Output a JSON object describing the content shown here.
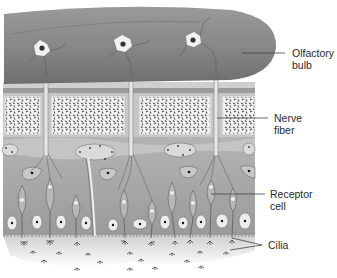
{
  "diagram": {
    "colors": {
      "bulb": "#8a8a8a",
      "bulb_highlight": "#a5a5a5",
      "bone_plate": "#b0b0b0",
      "bone_block": "#f2f2f2",
      "tissue": "#a8a8a8",
      "epithelium": "#9c9c9c",
      "mucus": "#e6e6e6",
      "cell_body": "#d8d8d8"
    },
    "labels": [
      {
        "id": "olfactory-bulb",
        "lines": [
          "Olfactory",
          "bulb"
        ]
      },
      {
        "id": "nerve-fiber",
        "lines": [
          "Nerve",
          "fiber"
        ]
      },
      {
        "id": "receptor-cell",
        "lines": [
          "Receptor",
          "cell"
        ]
      },
      {
        "id": "cilia",
        "lines": [
          "Cilia"
        ]
      }
    ]
  }
}
